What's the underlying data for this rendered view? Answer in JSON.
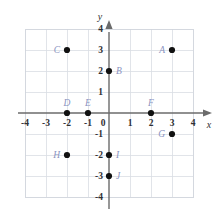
{
  "chart_data": {
    "type": "scatter",
    "title": "",
    "xlabel": "x",
    "ylabel": "y",
    "xlim": [
      -4,
      4
    ],
    "ylim": [
      -4,
      4
    ],
    "grid": true,
    "legend": "none",
    "x_ticks": [
      "-4",
      "-3",
      "-2",
      "-1",
      "0",
      "1",
      "2",
      "3",
      "4"
    ],
    "x_tick_values": [
      -4,
      -3,
      -2,
      -1,
      0,
      1,
      2,
      3,
      4
    ],
    "y_ticks": [
      "4",
      "3",
      "2",
      "1",
      "-1",
      "-2",
      "-3",
      "-4"
    ],
    "y_tick_values": [
      4,
      3,
      2,
      1,
      -1,
      -2,
      -3,
      -4
    ],
    "point_color": "#111111",
    "label_color": "#8a93bf",
    "axis_color": "#6b6b6b",
    "grid_color": "#d9dde4",
    "points": [
      {
        "label": "A",
        "x": 3,
        "y": 3,
        "label_pos": "left"
      },
      {
        "label": "B",
        "x": 0,
        "y": 2,
        "label_pos": "right"
      },
      {
        "label": "C",
        "x": -2,
        "y": 3,
        "label_pos": "left"
      },
      {
        "label": "D",
        "x": -2,
        "y": 0,
        "label_pos": "above"
      },
      {
        "label": "E",
        "x": -1,
        "y": 0,
        "label_pos": "above"
      },
      {
        "label": "F",
        "x": 2,
        "y": 0,
        "label_pos": "above"
      },
      {
        "label": "G",
        "x": 3,
        "y": -1,
        "label_pos": "left"
      },
      {
        "label": "H",
        "x": -2,
        "y": -2,
        "label_pos": "left"
      },
      {
        "label": "I",
        "x": 0,
        "y": -2,
        "label_pos": "right"
      },
      {
        "label": "J",
        "x": 0,
        "y": -3,
        "label_pos": "right"
      }
    ]
  },
  "geometry": {
    "origin_x": 109,
    "origin_y": 113,
    "unit": 21,
    "grid_min": -4,
    "grid_max": 4,
    "dot_radius": 3.1
  }
}
